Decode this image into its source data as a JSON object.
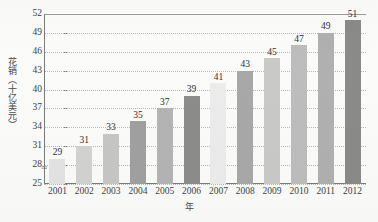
{
  "chart_data": {
    "type": "bar",
    "title": "",
    "xlabel": "年",
    "ylabel": "花销（十亿美元）",
    "categories": [
      "2001",
      "2002",
      "2003",
      "2004",
      "2005",
      "2006",
      "2007",
      "2008",
      "2009",
      "2010",
      "2011",
      "2012"
    ],
    "values": [
      29,
      31,
      33,
      35,
      37,
      39,
      41,
      43,
      45,
      47,
      49,
      51
    ],
    "bar_colors": [
      "#e3e3e3",
      "#d2d2d2",
      "#c6c6c6",
      "#a0a0a0",
      "#b4b4b4",
      "#8c8c8c",
      "#ececec",
      "#a8a8a8",
      "#c9c9c9",
      "#bdbdbd",
      "#b0b0b0",
      "#8a8a8a"
    ],
    "ylim": [
      25,
      52
    ],
    "yticks": [
      25,
      28,
      31,
      34,
      37,
      40,
      43,
      46,
      49,
      52
    ],
    "ytick_labels": [
      "25",
      "28",
      "31",
      "34",
      "37",
      "40",
      "43",
      "46",
      "49",
      "52"
    ],
    "value_labels": [
      "29",
      "31",
      "33",
      "35",
      "37",
      "39",
      "41",
      "43",
      "45",
      "47",
      "49",
      "51"
    ],
    "grid": true,
    "grid_style": "dotted",
    "legend": "none",
    "axis_break": true,
    "axis_break_glyph": "≈"
  }
}
